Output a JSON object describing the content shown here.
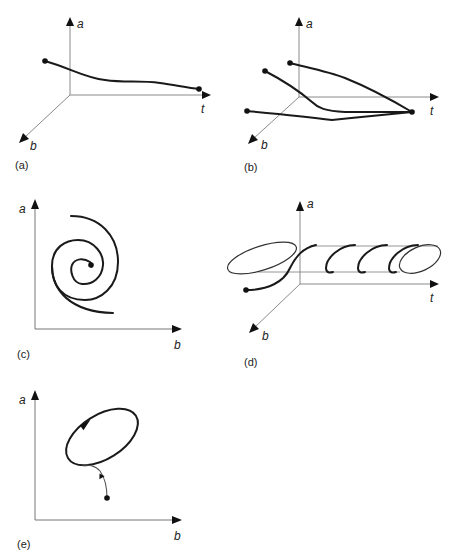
{
  "figure": {
    "panels": [
      {
        "id": "a",
        "label": "(a)",
        "axes": {
          "vertical": "a",
          "horizontal": "t",
          "depth": "b"
        },
        "description": "Single trajectory in (a, b, t) space converging toward a fixed point"
      },
      {
        "id": "b",
        "label": "(b)",
        "axes": {
          "vertical": "a",
          "horizontal": "t",
          "depth": "b"
        },
        "description": "Three trajectories from different initial points converging to the same fixed point"
      },
      {
        "id": "c",
        "label": "(c)",
        "axes": {
          "vertical": "a",
          "horizontal": "b"
        },
        "description": "Phase plane spiral converging to a stable focus"
      },
      {
        "id": "d",
        "label": "(d)",
        "axes": {
          "vertical": "a",
          "horizontal": "t",
          "depth": "b"
        },
        "description": "Trajectory settling onto a periodic orbit (helix around t axis)"
      },
      {
        "id": "e",
        "label": "(e)",
        "axes": {
          "vertical": "a",
          "horizontal": "b"
        },
        "description": "Phase plane trajectory approaching a limit cycle"
      }
    ]
  }
}
